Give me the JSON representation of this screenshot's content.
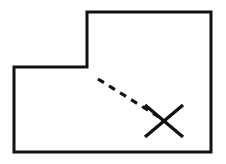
{
  "document": {
    "title": "L-Shaped Outline Diagram",
    "background_color": "#ffffff",
    "width": 226,
    "height": 164
  },
  "style": {
    "ink_color": "#111111",
    "outline_stroke_width": 3,
    "dashed_stroke_width": 3.2,
    "marker_stroke_width": 3.4,
    "dash_pattern": "7 6",
    "line_cap": "butt",
    "line_join": "miter"
  },
  "figure": {
    "name": "l-shaped-plan-with-marked-point",
    "outline": {
      "label": "L-shaped outline",
      "closed": true,
      "points": "87,12 211,12 211,152 14,152 14,67 87,67",
      "vertices": [
        {
          "name": "notch-top-left",
          "x": 87,
          "y": 12
        },
        {
          "name": "top-right",
          "x": 211,
          "y": 12
        },
        {
          "name": "bottom-right",
          "x": 211,
          "y": 152
        },
        {
          "name": "bottom-left",
          "x": 14,
          "y": 152
        },
        {
          "name": "left-step",
          "x": 14,
          "y": 67
        },
        {
          "name": "notch-inner-corner",
          "x": 87,
          "y": 67
        }
      ]
    },
    "leader_line": {
      "label": "dashed leader line",
      "x1": 98,
      "y1": 79,
      "x2": 159,
      "y2": 117
    },
    "cross_marker": {
      "label": "X mark",
      "center_x": 164,
      "center_y": 121,
      "half_width": 19,
      "half_height": 16,
      "stroke_1": {
        "x1": 145,
        "y1": 105,
        "x2": 183,
        "y2": 137
      },
      "stroke_2": {
        "x1": 183,
        "y1": 105,
        "x2": 145,
        "y2": 137
      }
    }
  }
}
